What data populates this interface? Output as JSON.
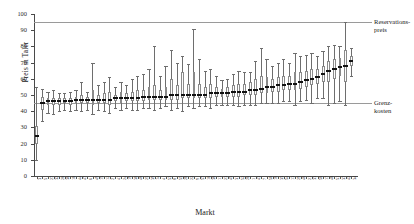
{
  "chart_data": {
    "type": "box",
    "title": "",
    "xlabel": "Markt",
    "ylabel": "Preis in Taler",
    "ylim": [
      0,
      100
    ],
    "yticks": [
      0,
      10,
      20,
      30,
      40,
      50,
      60,
      70,
      80,
      90,
      100
    ],
    "grid": false,
    "legend": "none",
    "reference_lines": [
      {
        "label": "Reservations-\npreis",
        "label_line1": "Reservations-",
        "label_line2": "preis",
        "value": 95,
        "color": "#9a9a9a"
      },
      {
        "label": "Grenz-\nkosten",
        "label_line1": "Grenz-",
        "label_line2": "kosten",
        "value": 45,
        "color": "#9a9a9a"
      }
    ],
    "categories": [
      "3",
      "5",
      "27",
      "32",
      "28",
      "36",
      "10",
      "44",
      "47",
      "6",
      "49",
      "15",
      "12",
      "2",
      "41",
      "24",
      "19",
      "30",
      "48",
      "25",
      "39",
      "14",
      "4",
      "53",
      "8",
      "55",
      "20",
      "22",
      "9",
      "57",
      "16",
      "38",
      "11",
      "23",
      "45",
      "31",
      "52",
      "26",
      "1",
      "43",
      "7",
      "50",
      "18",
      "35",
      "54",
      "13",
      "29",
      "46",
      "21",
      "33",
      "56",
      "17",
      "40",
      "51",
      "37",
      "42",
      "34"
    ],
    "boxes": [
      {
        "market": "3",
        "whisker_low": 10,
        "q1": 20,
        "median": 25,
        "q3": 31,
        "whisker_high": 55
      },
      {
        "market": "5",
        "whisker_low": 34,
        "q1": 41,
        "median": 45,
        "q3": 49,
        "whisker_high": 54
      },
      {
        "market": "27",
        "whisker_low": 39,
        "q1": 44,
        "median": 46,
        "q3": 48,
        "whisker_high": 52
      },
      {
        "market": "32",
        "whisker_low": 38,
        "q1": 44,
        "median": 46,
        "q3": 48,
        "whisker_high": 53
      },
      {
        "market": "28",
        "whisker_low": 40,
        "q1": 44,
        "median": 46,
        "q3": 48,
        "whisker_high": 51
      },
      {
        "market": "36",
        "whisker_low": 41,
        "q1": 45,
        "median": 46,
        "q3": 48,
        "whisker_high": 51
      },
      {
        "market": "10",
        "whisker_low": 40,
        "q1": 44,
        "median": 46,
        "q3": 48,
        "whisker_high": 52
      },
      {
        "market": "44",
        "whisker_low": 41,
        "q1": 45,
        "median": 47,
        "q3": 49,
        "whisker_high": 53
      },
      {
        "market": "47",
        "whisker_low": 40,
        "q1": 45,
        "median": 47,
        "q3": 50,
        "whisker_high": 58
      },
      {
        "market": "6",
        "whisker_low": 41,
        "q1": 45,
        "median": 47,
        "q3": 49,
        "whisker_high": 52
      },
      {
        "market": "49",
        "whisker_low": 38,
        "q1": 44,
        "median": 47,
        "q3": 53,
        "whisker_high": 70
      },
      {
        "market": "15",
        "whisker_low": 41,
        "q1": 45,
        "median": 47,
        "q3": 50,
        "whisker_high": 56
      },
      {
        "market": "12",
        "whisker_low": 40,
        "q1": 45,
        "median": 47,
        "q3": 51,
        "whisker_high": 58
      },
      {
        "market": "2",
        "whisker_low": 39,
        "q1": 44,
        "median": 47,
        "q3": 52,
        "whisker_high": 61
      },
      {
        "market": "41",
        "whisker_low": 42,
        "q1": 46,
        "median": 48,
        "q3": 50,
        "whisker_high": 55
      },
      {
        "market": "24",
        "whisker_low": 41,
        "q1": 45,
        "median": 48,
        "q3": 52,
        "whisker_high": 58
      },
      {
        "market": "19",
        "whisker_low": 42,
        "q1": 46,
        "median": 48,
        "q3": 51,
        "whisker_high": 56
      },
      {
        "market": "30",
        "whisker_low": 41,
        "q1": 46,
        "median": 48,
        "q3": 52,
        "whisker_high": 60
      },
      {
        "market": "48",
        "whisker_low": 41,
        "q1": 46,
        "median": 48,
        "q3": 53,
        "whisker_high": 62
      },
      {
        "market": "25",
        "whisker_low": 42,
        "q1": 46,
        "median": 49,
        "q3": 53,
        "whisker_high": 63
      },
      {
        "market": "39",
        "whisker_low": 42,
        "q1": 47,
        "median": 49,
        "q3": 55,
        "whisker_high": 66
      },
      {
        "market": "14",
        "whisker_low": 41,
        "q1": 47,
        "median": 49,
        "q3": 56,
        "whisker_high": 80
      },
      {
        "market": "4",
        "whisker_low": 42,
        "q1": 47,
        "median": 49,
        "q3": 53,
        "whisker_high": 62
      },
      {
        "market": "53",
        "whisker_low": 43,
        "q1": 47,
        "median": 49,
        "q3": 55,
        "whisker_high": 68
      },
      {
        "market": "8",
        "whisker_low": 41,
        "q1": 47,
        "median": 50,
        "q3": 60,
        "whisker_high": 78
      },
      {
        "market": "55",
        "whisker_low": 42,
        "q1": 47,
        "median": 50,
        "q3": 56,
        "whisker_high": 70
      },
      {
        "market": "20",
        "whisker_low": 40,
        "q1": 48,
        "median": 50,
        "q3": 64,
        "whisker_high": 74
      },
      {
        "market": "22",
        "whisker_low": 43,
        "q1": 48,
        "median": 50,
        "q3": 57,
        "whisker_high": 69
      },
      {
        "market": "9",
        "whisker_low": 42,
        "q1": 48,
        "median": 50,
        "q3": 64,
        "whisker_high": 91
      },
      {
        "market": "57",
        "whisker_low": 43,
        "q1": 48,
        "median": 50,
        "q3": 57,
        "whisker_high": 72
      },
      {
        "market": "16",
        "whisker_low": 43,
        "q1": 48,
        "median": 50,
        "q3": 55,
        "whisker_high": 65
      },
      {
        "market": "38",
        "whisker_low": 42,
        "q1": 48,
        "median": 51,
        "q3": 57,
        "whisker_high": 66
      },
      {
        "market": "11",
        "whisker_low": 44,
        "q1": 49,
        "median": 51,
        "q3": 55,
        "whisker_high": 62
      },
      {
        "market": "23",
        "whisker_low": 44,
        "q1": 49,
        "median": 51,
        "q3": 54,
        "whisker_high": 59
      },
      {
        "market": "45",
        "whisker_low": 44,
        "q1": 49,
        "median": 51,
        "q3": 55,
        "whisker_high": 60
      },
      {
        "market": "31",
        "whisker_low": 44,
        "q1": 49,
        "median": 52,
        "q3": 56,
        "whisker_high": 63
      },
      {
        "market": "52",
        "whisker_low": 43,
        "q1": 49,
        "median": 52,
        "q3": 57,
        "whisker_high": 65
      },
      {
        "market": "26",
        "whisker_low": 44,
        "q1": 50,
        "median": 52,
        "q3": 57,
        "whisker_high": 64
      },
      {
        "market": "1",
        "whisker_low": 44,
        "q1": 50,
        "median": 53,
        "q3": 58,
        "whisker_high": 64
      },
      {
        "market": "43",
        "whisker_low": 44,
        "q1": 50,
        "median": 53,
        "q3": 60,
        "whisker_high": 71
      },
      {
        "market": "7",
        "whisker_low": 45,
        "q1": 51,
        "median": 54,
        "q3": 62,
        "whisker_high": 79
      },
      {
        "market": "50",
        "whisker_low": 45,
        "q1": 51,
        "median": 55,
        "q3": 61,
        "whisker_high": 72
      },
      {
        "market": "18",
        "whisker_low": 45,
        "q1": 52,
        "median": 55,
        "q3": 60,
        "whisker_high": 68
      },
      {
        "market": "35",
        "whisker_low": 45,
        "q1": 52,
        "median": 56,
        "q3": 61,
        "whisker_high": 70
      },
      {
        "market": "54",
        "whisker_low": 46,
        "q1": 53,
        "median": 56,
        "q3": 62,
        "whisker_high": 72
      },
      {
        "market": "13",
        "whisker_low": 46,
        "q1": 53,
        "median": 57,
        "q3": 62,
        "whisker_high": 70
      },
      {
        "market": "29",
        "whisker_low": 44,
        "q1": 53,
        "median": 57,
        "q3": 64,
        "whisker_high": 76
      },
      {
        "market": "46",
        "whisker_low": 46,
        "q1": 54,
        "median": 58,
        "q3": 64,
        "whisker_high": 74
      },
      {
        "market": "21",
        "whisker_low": 47,
        "q1": 55,
        "median": 59,
        "q3": 65,
        "whisker_high": 75
      },
      {
        "market": "33",
        "whisker_low": 45,
        "q1": 56,
        "median": 60,
        "q3": 66,
        "whisker_high": 76
      },
      {
        "market": "56",
        "whisker_low": 48,
        "q1": 57,
        "median": 61,
        "q3": 66,
        "whisker_high": 74
      },
      {
        "market": "17",
        "whisker_low": 48,
        "q1": 58,
        "median": 63,
        "q3": 68,
        "whisker_high": 77
      },
      {
        "market": "40",
        "whisker_low": 44,
        "q1": 58,
        "median": 65,
        "q3": 71,
        "whisker_high": 80
      },
      {
        "market": "51",
        "whisker_low": 45,
        "q1": 60,
        "median": 66,
        "q3": 72,
        "whisker_high": 81
      },
      {
        "market": "37",
        "whisker_low": 46,
        "q1": 62,
        "median": 67,
        "q3": 73,
        "whisker_high": 80
      },
      {
        "market": "42",
        "whisker_low": 44,
        "q1": 58,
        "median": 68,
        "q3": 78,
        "whisker_high": 95
      },
      {
        "market": "34",
        "whisker_low": 62,
        "q1": 68,
        "median": 71,
        "q3": 74,
        "whisker_high": 79
      }
    ]
  }
}
